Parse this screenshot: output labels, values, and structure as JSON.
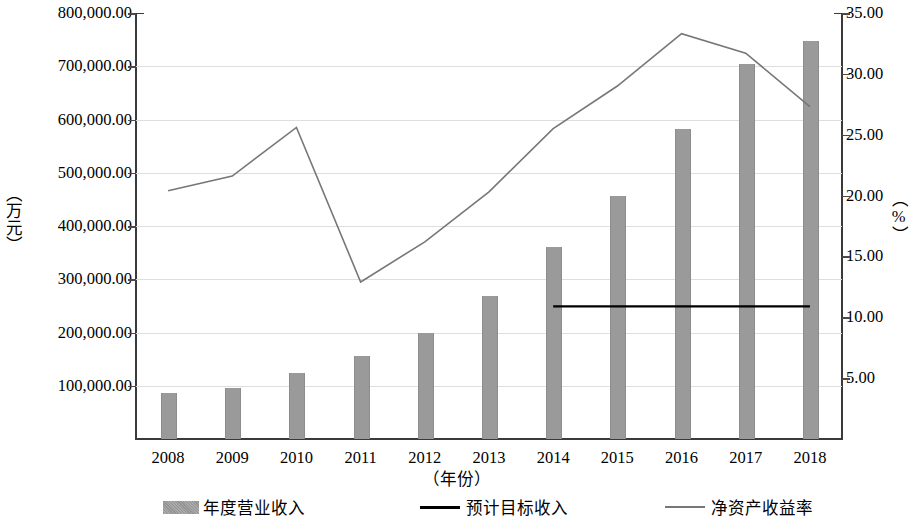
{
  "chart_data": {
    "type": "bar",
    "title": "",
    "xlabel": "（年份）",
    "ylabel": "（万元）",
    "ylabel_right": "（%）",
    "categories": [
      "2008",
      "2009",
      "2010",
      "2011",
      "2012",
      "2013",
      "2014",
      "2015",
      "2016",
      "2017",
      "2018"
    ],
    "ylim": [
      0,
      800000
    ],
    "ylim_right": [
      0,
      35
    ],
    "y_ticks": [
      "100,000.00",
      "200,000.00",
      "300,000.00",
      "400,000.00",
      "500,000.00",
      "600,000.00",
      "700,000.00",
      "800,000.00"
    ],
    "y_tick_values": [
      100000,
      200000,
      300000,
      400000,
      500000,
      600000,
      700000,
      800000
    ],
    "y_ticks_right": [
      "5.00",
      "10.00",
      "15.00",
      "20.00",
      "25.00",
      "30.00",
      "35.00"
    ],
    "y_tick_values_right": [
      5,
      10,
      15,
      20,
      25,
      30,
      35
    ],
    "grid": true,
    "legend_position": "bottom",
    "series": [
      {
        "name": "年度营业收入",
        "type": "bar",
        "axis": "left",
        "color": "#9a9a9a",
        "values": [
          86000,
          95000,
          124000,
          155000,
          200000,
          268000,
          360000,
          456000,
          583000,
          705000,
          748000
        ]
      },
      {
        "name": "预计目标收入",
        "type": "line",
        "axis": "left",
        "color": "#000000",
        "x": [
          "2014",
          "2015",
          "2016",
          "2017",
          "2018"
        ],
        "values": [
          249000,
          249000,
          249000,
          249000,
          249000
        ]
      },
      {
        "name": "净资产收益率",
        "type": "line",
        "axis": "right",
        "color": "#777777",
        "values": [
          20.4,
          21.6,
          25.6,
          12.9,
          16.2,
          20.3,
          25.5,
          29.0,
          33.3,
          31.7,
          27.3
        ]
      }
    ]
  },
  "legend": {
    "items": [
      {
        "label": "年度营业收入",
        "marker": "bar-swatch",
        "color": "#9a9a9a"
      },
      {
        "label": "预计目标收入",
        "marker": "line-black",
        "color": "#000000"
      },
      {
        "label": "净资产收益率",
        "marker": "line-gray",
        "color": "#777777"
      }
    ]
  }
}
